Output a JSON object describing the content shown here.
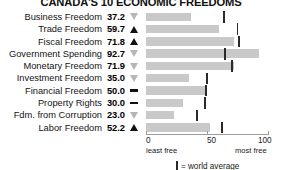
{
  "chart_data": {
    "type": "bar",
    "title": "CANADA'S 10 ECONOMIC FREEDOMS",
    "xlabel": "",
    "ylabel": "",
    "xlim": [
      0,
      100
    ],
    "grid": false,
    "orientation": "horizontal",
    "axis": {
      "ticks": [
        {
          "value": 0,
          "label": "0",
          "caption": "least free"
        },
        {
          "value": 50,
          "label": "50",
          "caption": ""
        },
        {
          "value": 100,
          "label": "100",
          "caption": "most free"
        }
      ]
    },
    "legend": {
      "position": "bottom-center",
      "marker_name": "world-average-marker",
      "text": "= world average"
    },
    "categories": [
      "Business Freedom",
      "Trade Freedom",
      "Fiscal Freedom",
      "Government Spending",
      "Monetary Freedom",
      "Investment Freedom",
      "Financial Freedom",
      "Property Rights",
      "Fdm. from Corruption",
      "Labor Freedom"
    ],
    "values": [
      37.2,
      59.7,
      71.8,
      92.7,
      71.9,
      35.0,
      50.0,
      30.0,
      23.0,
      52.2
    ],
    "value_labels": [
      "37.2",
      "59.7",
      "71.8",
      "92.7",
      "71.9",
      "35.0",
      "50.0",
      "30.0",
      "23.0",
      "52.2"
    ],
    "world_average": [
      64.0,
      75.0,
      76.5,
      65.0,
      70.5,
      50.0,
      49.0,
      48.0,
      42.0,
      62.0
    ],
    "trend": [
      "down",
      "up",
      "up",
      "down",
      "down",
      "down",
      "flat",
      "flat",
      "down",
      "up"
    ],
    "trend_glyph_names": [
      "triangle-down-hollow-icon",
      "triangle-up-icon",
      "triangle-up-icon",
      "triangle-down-hollow-icon",
      "triangle-down-hollow-icon",
      "triangle-down-hollow-icon",
      "dash-flat-icon",
      "dash-flat-icon",
      "triangle-down-hollow-icon",
      "triangle-up-icon"
    ],
    "colors": {
      "bar": "#c9c9c9",
      "average_marker": "#2a2a2a",
      "trend_up": "#111111",
      "trend_down": "#b6b6b6",
      "axis": "#9b9b9b",
      "text": "#1a1a1a",
      "background": "#ffffff"
    }
  }
}
